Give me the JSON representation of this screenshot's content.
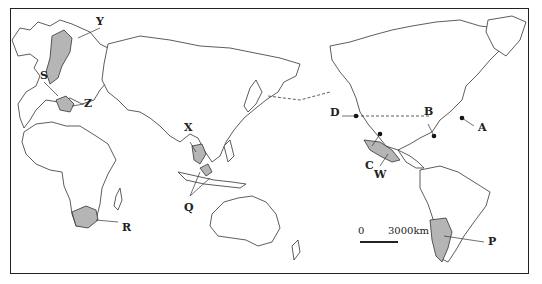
{
  "map": {
    "projection": "pacific-centered world map",
    "scale_bar": {
      "zero_label": "0",
      "distance_label": "3000km"
    },
    "shade_color": "#b5b5b5",
    "labels": {
      "Y": "Y",
      "S": "S",
      "Z": "Z",
      "X": "X",
      "Q": "Q",
      "R": "R",
      "D": "D",
      "B": "B",
      "C": "C",
      "A": "A",
      "W": "W",
      "P": "P"
    },
    "shaded_regions": [
      {
        "label": "S",
        "region": "Scandinavia / Central Europe"
      },
      {
        "label": "Z",
        "region": "Italy"
      },
      {
        "label": "X",
        "region": "Indochina (Thailand)"
      },
      {
        "label": "Q",
        "region": "Malaysia / Indonesia"
      },
      {
        "label": "R",
        "region": "South Africa"
      },
      {
        "label": "W",
        "region": "Mexico"
      },
      {
        "label": "P",
        "region": "Argentina"
      }
    ],
    "point_markers": [
      "A",
      "B",
      "C",
      "D"
    ]
  }
}
